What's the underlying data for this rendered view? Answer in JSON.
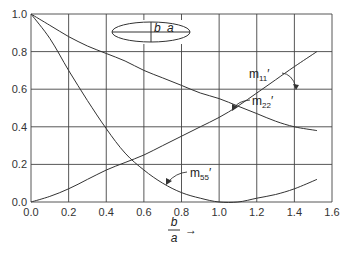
{
  "chart_data": {
    "type": "line",
    "title": "",
    "xlabel": "b/a",
    "ylabel": "",
    "xlim": [
      0.0,
      1.6
    ],
    "ylim": [
      0.0,
      1.0
    ],
    "x_ticks": [
      "0.0",
      "0.2",
      "0.4",
      "0.6",
      "0.8",
      "1.0",
      "1.2",
      "1.4",
      "1.6"
    ],
    "y_ticks": [
      "0.0",
      "0.2",
      "0.4",
      "0.6",
      "0.8",
      "1.0"
    ],
    "grid": true,
    "legend": "inline annotations with leader arrows",
    "inset": {
      "shape": "ellipse",
      "labels": [
        "b",
        "a"
      ]
    },
    "x": [
      0.0,
      0.1,
      0.2,
      0.3,
      0.4,
      0.5,
      0.6,
      0.7,
      0.8,
      0.9,
      1.0,
      1.1,
      1.2,
      1.3,
      1.4,
      1.52
    ],
    "series": [
      {
        "name": "m11'",
        "values": [
          0.0,
          0.03,
          0.07,
          0.12,
          0.17,
          0.21,
          0.25,
          0.3,
          0.35,
          0.4,
          0.45,
          0.51,
          0.58,
          0.65,
          0.72,
          0.8
        ]
      },
      {
        "name": "m22'",
        "values": [
          1.0,
          0.94,
          0.88,
          0.83,
          0.79,
          0.75,
          0.7,
          0.66,
          0.62,
          0.58,
          0.55,
          0.51,
          0.47,
          0.43,
          0.4,
          0.38
        ]
      },
      {
        "name": "m55'",
        "values": [
          1.0,
          0.87,
          0.7,
          0.54,
          0.39,
          0.26,
          0.17,
          0.1,
          0.05,
          0.02,
          0.0,
          0.0,
          0.02,
          0.04,
          0.07,
          0.12
        ]
      }
    ]
  },
  "labels": {
    "m11": {
      "base": "m",
      "sub": "11",
      "prime": "′"
    },
    "m22": {
      "base": "m",
      "sub": "22",
      "prime": "′"
    },
    "m55": {
      "base": "m",
      "sub": "55",
      "prime": "′"
    },
    "inset_b": "b",
    "inset_a": "a",
    "xlabel_num": "b",
    "xlabel_den": "a",
    "xlabel_arrow": "→"
  }
}
